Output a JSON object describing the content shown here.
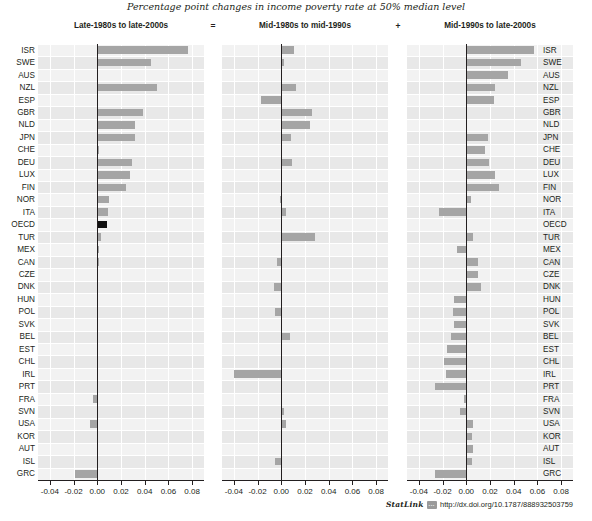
{
  "figure": {
    "subtitle": "Percentage point changes in income poverty rate at 50% median level",
    "operator_equals": "=",
    "operator_plus": "+"
  },
  "footer": {
    "statlink_label": "StatLink",
    "statlink_badge": "···",
    "url": "http://dx.doi.org/10.1787/888932503759"
  },
  "axis": {
    "ticks": [
      "-0.04",
      "-0.02",
      "0.00",
      "0.02",
      "0.04",
      "0.06",
      "0.08"
    ],
    "tick_values": [
      -0.04,
      -0.02,
      0.0,
      0.02,
      0.04,
      0.06,
      0.08
    ],
    "min": -0.05,
    "max": 0.09
  },
  "colors": {
    "bar": "#a5a5a5",
    "highlight_bar": "#111111",
    "plot_background": "#ececec",
    "gridline": "#ffffff",
    "zero_line": "#231f20",
    "text": "#231f20"
  },
  "chart_data": {
    "type": "bar",
    "title": "Percentage point changes in income poverty rate at 50% median level",
    "xlabel": "",
    "ylabel": "",
    "xlim": [
      -0.05,
      0.09
    ],
    "grid": true,
    "legend": "none",
    "orientation": "horizontal",
    "highlight_category": "OECD",
    "categories": [
      "ISR",
      "SWE",
      "AUS",
      "NZL",
      "ESP",
      "GBR",
      "NLD",
      "JPN",
      "CHE",
      "DEU",
      "LUX",
      "FIN",
      "NOR",
      "ITA",
      "OECD",
      "TUR",
      "MEX",
      "CAN",
      "CZE",
      "DNK",
      "HUN",
      "POL",
      "SVK",
      "BEL",
      "EST",
      "CHL",
      "IRL",
      "PRT",
      "FRA",
      "SVN",
      "USA",
      "KOR",
      "AUT",
      "ISL",
      "GRC"
    ],
    "panels": [
      {
        "label": "Late-1980s to late-2000s",
        "operator_after": "=",
        "values": [
          0.0765,
          0.0455,
          0.0005,
          0.0505,
          0.001,
          0.0385,
          0.032,
          0.032,
          0.0015,
          0.029,
          0.0275,
          0.0245,
          0.01,
          0.009,
          0.008,
          0.0035,
          0.0015,
          0.0015,
          0.0008,
          0.0005,
          0.0005,
          0.0005,
          0.0005,
          0.0005,
          0.0005,
          0.0005,
          0.0005,
          0.0005,
          -0.004,
          0.0005,
          -0.006,
          0.0005,
          0.0005,
          0.0005,
          -0.0185
        ]
      },
      {
        "label": "Mid-1980s to mid-1990s",
        "operator_after": "+",
        "values": [
          0.011,
          0.002,
          0.0005,
          0.0125,
          -0.0175,
          0.026,
          0.024,
          0.0085,
          0.0005,
          0.009,
          0.0005,
          0.0005,
          -0.0015,
          0.004,
          0.0005,
          0.0285,
          0.0005,
          -0.0035,
          0.0005,
          -0.006,
          0.0005,
          -0.0055,
          0.0005,
          0.007,
          0.0005,
          0.0005,
          -0.0395,
          0.0005,
          0.0005,
          0.002,
          0.004,
          0.0005,
          0.0005,
          -0.0055,
          0.0005,
          0.009,
          0.0005
        ]
      },
      {
        "label": "Mid-1990s to late-2000s",
        "operator_after": "",
        "values": [
          0.057,
          0.0465,
          0.035,
          0.0245,
          0.023,
          0.001,
          0.001,
          0.018,
          0.0155,
          0.019,
          0.024,
          0.028,
          0.004,
          -0.023,
          0.0005,
          0.0055,
          -0.008,
          0.0095,
          0.0095,
          0.012,
          -0.0105,
          -0.011,
          -0.0105,
          -0.013,
          -0.016,
          -0.0185,
          -0.0175,
          -0.0265,
          -0.002,
          -0.0055,
          0.0055,
          0.005,
          0.0055,
          0.0045,
          -0.026
        ]
      }
    ]
  }
}
